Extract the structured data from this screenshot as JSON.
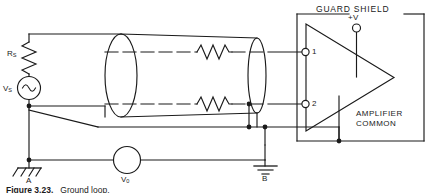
{
  "figure": {
    "labels": {
      "guard_shield": "GUARD SHIELD",
      "supply": "+V",
      "amplifier_common_line1": "AMPLIFIER",
      "amplifier_common_line2": "COMMON",
      "terminal_1": "1",
      "terminal_2": "2",
      "ground_a": "A",
      "ground_b": "B",
      "source_resistor": "R",
      "source_resistor_sub": "S",
      "source_voltage": "V",
      "source_voltage_sub": "S",
      "meter_voltage": "V",
      "meter_voltage_sub": "0"
    },
    "caption": {
      "figure_number": "Figure 3.23.",
      "text": "Ground loop."
    },
    "components": {
      "cable_conductor_top": "shielded-cable-conductor-top",
      "cable_conductor_bottom": "shielded-cable-conductor-bottom",
      "resistor_top": "cable-resistance-top",
      "resistor_bottom": "cable-resistance-bottom",
      "shield": "cable-shield",
      "amplifier": "differential-amplifier"
    },
    "colors": {
      "line": "#1a1a1a",
      "background": "#ffffff"
    }
  }
}
